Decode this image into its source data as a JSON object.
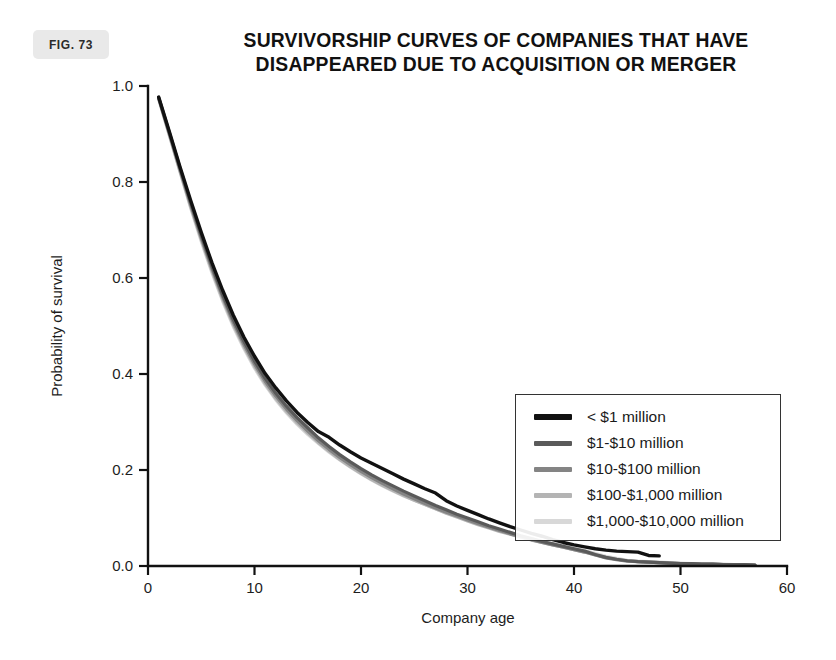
{
  "figure": {
    "badge_label": "FIG. 73",
    "badge_color": "#e9e9e9"
  },
  "chart_data": {
    "type": "line",
    "title": "SURVIVORSHIP CURVES OF COMPANIES THAT HAVE DISAPPEARED DUE TO ACQUISITION OR MERGER",
    "title_lines": [
      "SURVIVORSHIP CURVES OF COMPANIES THAT HAVE",
      "DISAPPEARED DUE TO ACQUISITION OR MERGER"
    ],
    "xlabel": "Company age",
    "ylabel": "Probability of survival",
    "xlim": [
      0,
      60
    ],
    "ylim": [
      0.0,
      1.0
    ],
    "xticks": [
      0,
      10,
      20,
      30,
      40,
      50,
      60
    ],
    "xtick_labels": [
      "0",
      "10",
      "20",
      "30",
      "40",
      "50",
      "60"
    ],
    "yticks": [
      0.0,
      0.2,
      0.4,
      0.6,
      0.8,
      1.0
    ],
    "ytick_labels": [
      "0.0",
      "0.2",
      "0.4",
      "0.6",
      "0.8",
      "1.0"
    ],
    "grid": false,
    "legend_position": "center-right",
    "series": [
      {
        "name": "< $1 million",
        "color": "#111111",
        "width": 3.4,
        "x": [
          1,
          2,
          3,
          4,
          5,
          6,
          7,
          8,
          9,
          10,
          11,
          12,
          13,
          14,
          15,
          16,
          17,
          18,
          19,
          20,
          21,
          22,
          23,
          24,
          25,
          26,
          27,
          28,
          29,
          30,
          31,
          32,
          33,
          34,
          35,
          36,
          37,
          38,
          39,
          40,
          41,
          42,
          43,
          44,
          45,
          46,
          47,
          48
        ],
        "y": [
          0.977,
          0.905,
          0.832,
          0.762,
          0.695,
          0.632,
          0.575,
          0.523,
          0.477,
          0.437,
          0.401,
          0.371,
          0.344,
          0.32,
          0.299,
          0.28,
          0.268,
          0.252,
          0.238,
          0.225,
          0.214,
          0.203,
          0.192,
          0.181,
          0.171,
          0.161,
          0.152,
          0.136,
          0.125,
          0.116,
          0.107,
          0.098,
          0.09,
          0.082,
          0.075,
          0.068,
          0.062,
          0.055,
          0.049,
          0.044,
          0.04,
          0.036,
          0.033,
          0.031,
          0.03,
          0.029,
          0.022,
          0.021
        ]
      },
      {
        "name": "$1-$10 million",
        "color": "#5a5a5a",
        "width": 3.2,
        "x": [
          1,
          2,
          3,
          4,
          5,
          6,
          7,
          8,
          9,
          10,
          11,
          12,
          13,
          14,
          15,
          16,
          17,
          18,
          19,
          20,
          21,
          22,
          23,
          24,
          25,
          26,
          27,
          28,
          29,
          30,
          31,
          32,
          33,
          34,
          35,
          36,
          37,
          38,
          39,
          40,
          41,
          42,
          43,
          44,
          45,
          46,
          47,
          48,
          49,
          50,
          51,
          52,
          53,
          54,
          55,
          56,
          57
        ],
        "y": [
          0.976,
          0.903,
          0.829,
          0.757,
          0.689,
          0.625,
          0.566,
          0.514,
          0.468,
          0.427,
          0.391,
          0.36,
          0.333,
          0.309,
          0.288,
          0.267,
          0.249,
          0.232,
          0.217,
          0.203,
          0.19,
          0.178,
          0.167,
          0.156,
          0.146,
          0.136,
          0.126,
          0.117,
          0.108,
          0.1,
          0.092,
          0.084,
          0.077,
          0.07,
          0.063,
          0.057,
          0.051,
          0.046,
          0.041,
          0.036,
          0.031,
          0.024,
          0.018,
          0.014,
          0.011,
          0.009,
          0.008,
          0.007,
          0.006,
          0.005,
          0.005,
          0.004,
          0.004,
          0.003,
          0.003,
          0.003,
          0.002
        ]
      },
      {
        "name": "$10-$100 million",
        "color": "#848484",
        "width": 3.2,
        "x": [
          1,
          2,
          3,
          4,
          5,
          6,
          7,
          8,
          9,
          10,
          11,
          12,
          13,
          14,
          15,
          16,
          17,
          18,
          19,
          20,
          21,
          22,
          23,
          24,
          25,
          26,
          27,
          28,
          29,
          30,
          31,
          32,
          33,
          34,
          35,
          36,
          37,
          38,
          39,
          40,
          41,
          42,
          43,
          44,
          45,
          46,
          47,
          48,
          49,
          50,
          51,
          52,
          53,
          54,
          55,
          56,
          57
        ],
        "y": [
          0.975,
          0.901,
          0.826,
          0.753,
          0.684,
          0.62,
          0.561,
          0.508,
          0.462,
          0.421,
          0.385,
          0.354,
          0.327,
          0.303,
          0.281,
          0.261,
          0.243,
          0.226,
          0.211,
          0.197,
          0.184,
          0.172,
          0.161,
          0.15,
          0.14,
          0.13,
          0.121,
          0.112,
          0.104,
          0.096,
          0.088,
          0.081,
          0.074,
          0.067,
          0.061,
          0.055,
          0.049,
          0.044,
          0.039,
          0.034,
          0.029,
          0.023,
          0.017,
          0.013,
          0.01,
          0.009,
          0.008,
          0.007,
          0.006,
          0.005,
          0.005,
          0.004,
          0.004,
          0.003,
          0.003,
          0.003,
          0.002
        ]
      },
      {
        "name": "$100-$1,000 million",
        "color": "#b4b4b4",
        "width": 3.2,
        "x": [
          1,
          2,
          3,
          4,
          5,
          6,
          7,
          8,
          9,
          10,
          11,
          12,
          13,
          14,
          15,
          16,
          17,
          18,
          19,
          20,
          21,
          22,
          23,
          24,
          25,
          26,
          27,
          28,
          29,
          30,
          31,
          32,
          33,
          34,
          35,
          36,
          37,
          38,
          39,
          40,
          41,
          42,
          43,
          44,
          45,
          46,
          47,
          48,
          49,
          50,
          51,
          52,
          53,
          54,
          55,
          56,
          57
        ],
        "y": [
          0.974,
          0.899,
          0.823,
          0.749,
          0.68,
          0.615,
          0.556,
          0.503,
          0.457,
          0.416,
          0.38,
          0.349,
          0.322,
          0.298,
          0.277,
          0.257,
          0.239,
          0.222,
          0.207,
          0.193,
          0.18,
          0.168,
          0.157,
          0.147,
          0.137,
          0.128,
          0.119,
          0.11,
          0.102,
          0.094,
          0.086,
          0.079,
          0.072,
          0.066,
          0.06,
          0.054,
          0.049,
          0.044,
          0.039,
          0.034,
          0.029,
          0.023,
          0.018,
          0.014,
          0.011,
          0.009,
          0.008,
          0.007,
          0.006,
          0.005,
          0.005,
          0.004,
          0.004,
          0.003,
          0.003,
          0.003,
          0.002
        ]
      },
      {
        "name": "$1,000-$10,000 million",
        "color": "#d8d8d8",
        "width": 3.2,
        "x": [
          1,
          2,
          3,
          4,
          5,
          6,
          7,
          8,
          9,
          10,
          11,
          12,
          13,
          14,
          15,
          16,
          17,
          18,
          19,
          20,
          21,
          22,
          23,
          24,
          25,
          26,
          27,
          28,
          29,
          30,
          31,
          32,
          33,
          34,
          35,
          36,
          37,
          38,
          39,
          40,
          41,
          42,
          43,
          44,
          45,
          46,
          47,
          48,
          49,
          50,
          51,
          52,
          53,
          54,
          55,
          56,
          57
        ],
        "y": [
          0.973,
          0.897,
          0.821,
          0.746,
          0.676,
          0.611,
          0.552,
          0.499,
          0.453,
          0.412,
          0.377,
          0.346,
          0.319,
          0.295,
          0.274,
          0.255,
          0.237,
          0.221,
          0.206,
          0.192,
          0.179,
          0.167,
          0.156,
          0.146,
          0.137,
          0.128,
          0.119,
          0.111,
          0.103,
          0.096,
          0.089,
          0.082,
          0.075,
          0.069,
          0.063,
          0.057,
          0.052,
          0.047,
          0.042,
          0.037,
          0.032,
          0.026,
          0.02,
          0.016,
          0.012,
          0.01,
          0.009,
          0.008,
          0.007,
          0.006,
          0.005,
          0.005,
          0.004,
          0.004,
          0.003,
          0.003,
          0.002
        ]
      }
    ]
  }
}
